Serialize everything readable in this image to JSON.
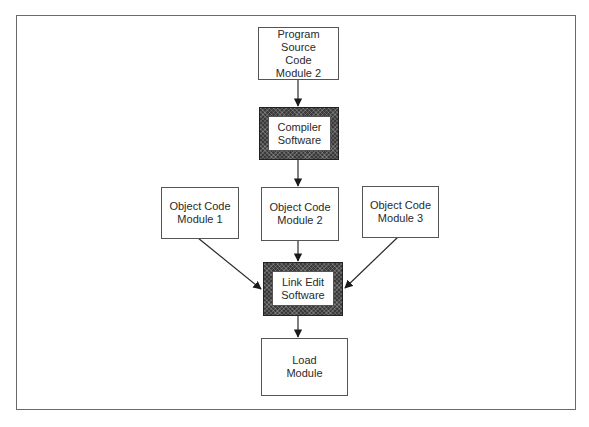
{
  "diagram": {
    "nodes": {
      "source": {
        "line1": "Program Source",
        "line2": "Code",
        "line3": "Module 2"
      },
      "compiler": {
        "line1": "Compiler",
        "line2": "Software"
      },
      "obj1": {
        "line1": "Object Code",
        "line2": "Module 1"
      },
      "obj2": {
        "line1": "Object Code",
        "line2": "Module 2"
      },
      "obj3": {
        "line1": "Object Code",
        "line2": "Module 3"
      },
      "linkedit": {
        "line1": "Link Edit",
        "line2": "Software"
      },
      "load": {
        "line1": "Load",
        "line2": "Module"
      }
    },
    "edges": [
      {
        "from": "source",
        "to": "compiler"
      },
      {
        "from": "compiler",
        "to": "obj2"
      },
      {
        "from": "obj1",
        "to": "linkedit"
      },
      {
        "from": "obj2",
        "to": "linkedit"
      },
      {
        "from": "obj3",
        "to": "linkedit"
      },
      {
        "from": "linkedit",
        "to": "load"
      }
    ],
    "colors": {
      "line": "#2a2a2a",
      "hatch": "#3a3a3a",
      "border": "#6a6a6a"
    }
  }
}
